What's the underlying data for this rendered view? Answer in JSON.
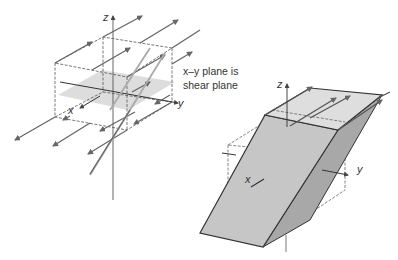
{
  "figure": {
    "left_panel": {
      "axes": {
        "z": "z",
        "x": "x",
        "y": "y"
      },
      "annotation": {
        "line1": "x–y plane is",
        "line2": "shear plane"
      }
    },
    "right_panel": {
      "axes": {
        "z": "z",
        "x": "x",
        "y": "y"
      }
    },
    "colors": {
      "line": "#555555",
      "arrow_line": "#666666",
      "plane_fill": "#d9d9d9",
      "front_face": "#c8c8c8",
      "side_face": "#a8a8a8",
      "top_face": "#dcdcdc"
    }
  }
}
